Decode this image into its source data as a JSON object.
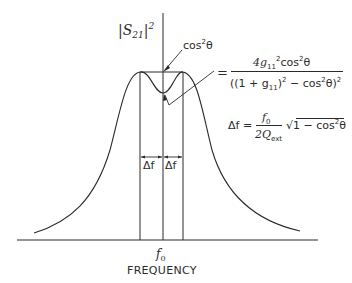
{
  "diagram": {
    "type": "filter-response-curve",
    "y_axis_label": {
      "base": "|S",
      "subscript": "21",
      "close": "|",
      "superscript": "2"
    },
    "x_axis_label": "FREQUENCY",
    "center_frequency_label": {
      "base": "f",
      "subscript": "0"
    },
    "annotations": {
      "peak_label": {
        "base": "cos",
        "superscript": "2",
        "tail": "θ"
      },
      "dip_equation": {
        "equals": "=",
        "numerator": {
          "coef": "4g",
          "sub": "11",
          "sup": "2",
          "rest": "cos",
          "rest_sup": "2",
          "tail": "θ"
        },
        "denominator": {
          "open": "((1 + g",
          "sub": "11",
          "mid": ")",
          "mid_sup": "2",
          "rest": " − cos",
          "rest_sup": "2",
          "tail": "θ)",
          "tail_sup": "2"
        }
      },
      "bandwidth_equation": {
        "lhs": "Δf =",
        "numerator": {
          "base": "f",
          "sub": "0"
        },
        "denominator": {
          "base": "2Q",
          "sub": "ext"
        },
        "sqrt_symbol": "√",
        "radicand": {
          "text": "1 − cos",
          "sup": "2",
          "tail": "θ"
        }
      },
      "delta_left": "Δf",
      "delta_right": "Δf"
    },
    "colors": {
      "line": "#2a2a2a",
      "background": "#ffffff"
    }
  }
}
